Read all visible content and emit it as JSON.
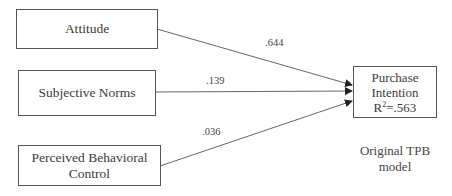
{
  "diagram": {
    "nodes": [
      {
        "id": "attitude",
        "label": "Attitude"
      },
      {
        "id": "subjective_norms",
        "label": "Subjective Norms"
      },
      {
        "id": "pbc",
        "label_line1": "Perceived Behavioral",
        "label_line2": "Control"
      },
      {
        "id": "purchase_intention",
        "label_line1": "Purchase",
        "label_line2": "Intention",
        "r2_prefix": "R",
        "r2_sup": "2",
        "r2_value": "=.563"
      }
    ],
    "edges": [
      {
        "from": "attitude",
        "to": "purchase_intention",
        "coefficient": ".644"
      },
      {
        "from": "subjective_norms",
        "to": "purchase_intention",
        "coefficient": ".139"
      },
      {
        "from": "pbc",
        "to": "purchase_intention",
        "coefficient": ".036"
      }
    ],
    "caption_line1": "Original TPB",
    "caption_line2": "model"
  }
}
